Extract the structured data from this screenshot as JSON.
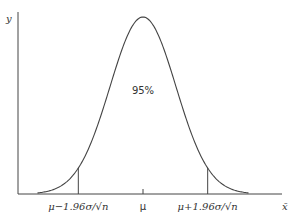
{
  "chart_data": {
    "type": "line",
    "title": "",
    "xlabel": "x̄",
    "ylabel": "y",
    "distribution": "normal",
    "mean_label": "μ",
    "critical_z": 1.96,
    "x_range_sd": [
      -3.2,
      3.2
    ],
    "markers": [
      {
        "name": "lower",
        "z": -1.96,
        "label": "μ−1.96σ/√n"
      },
      {
        "name": "center",
        "z": 0,
        "label": "μ"
      },
      {
        "name": "upper",
        "z": 1.96,
        "label": "μ+1.96σ/√n"
      }
    ],
    "annotation": "95%",
    "grid": false,
    "legend": "none"
  }
}
